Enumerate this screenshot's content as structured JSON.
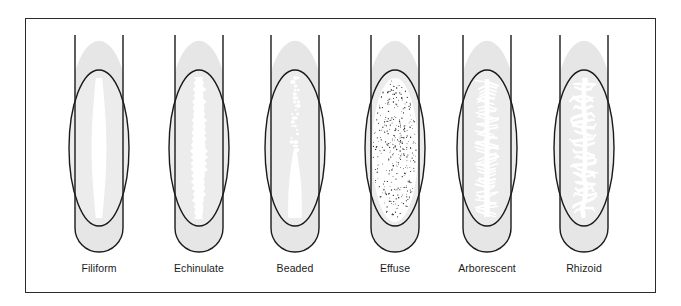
{
  "figure": {
    "frame": {
      "border_color": "#2b2b2b",
      "background_color": "#ffffff"
    },
    "colors": {
      "agar_fill": "#e6e6e6",
      "agar_fill_light": "#ececec",
      "growth_fill": "#ffffff",
      "outline": "#1a1a1a",
      "label_text": "#1b1b1b",
      "speckle": "#1a1a1a"
    },
    "tubes": [
      {
        "label": "Filiform",
        "pattern": "filiform",
        "description": "continuous, smooth-edged, even growth along the inoculation streak",
        "center_x": 99
      },
      {
        "label": "Echinulate",
        "pattern": "echinulate",
        "description": "growth with toothed, jagged, spiny margins along the streak line",
        "center_x": 199
      },
      {
        "label": "Beaded",
        "pattern": "beaded",
        "description": "separate or semi-confluent colonies forming beads along the streak",
        "center_x": 295
      },
      {
        "label": "Effuse",
        "pattern": "effuse",
        "description": "thin, spreading, veil-like growth covering the whole slant surface",
        "center_x": 395
      },
      {
        "label": "Arborescent",
        "pattern": "arborescent",
        "description": "tree-like branched growth extending from the inoculation streak",
        "center_x": 487
      },
      {
        "label": "Rhizoid",
        "pattern": "rhizoid",
        "description": "root-like, irregularly branched spreading growth",
        "center_x": 584
      }
    ]
  }
}
